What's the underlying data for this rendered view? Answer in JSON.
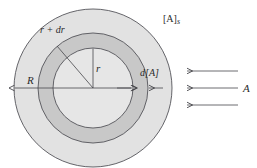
{
  "figure": {
    "name": "diffusion-into-sphere-diagram",
    "background": "#ffffff",
    "colors": {
      "outer_shell_fill": "#e0e0e0",
      "middle_fill": "#d6d6d6",
      "shell_fill": "#c0c0c0",
      "core_fill": "#e6e6e6",
      "stroke": "#55555a",
      "text": "#2b2b2b"
    },
    "geometry": {
      "center_x": 93,
      "center_y": 88,
      "outer_radius": 79,
      "middle_radius": 55,
      "inner_radius": 40
    },
    "labels": {
      "outer_radius": "R",
      "inner_radius": "r",
      "shell_outer_radius": "r + dr",
      "concentration_gradient": "d[A]",
      "surface_concentration_bracket": "[A]",
      "surface_concentration_subscript": "s",
      "reactant_flux": "A"
    },
    "arrows": {
      "flux_count": 3,
      "flux_direction": "left",
      "radius_arrow_direction": "left",
      "shell_arrow_pair": "inward"
    }
  }
}
